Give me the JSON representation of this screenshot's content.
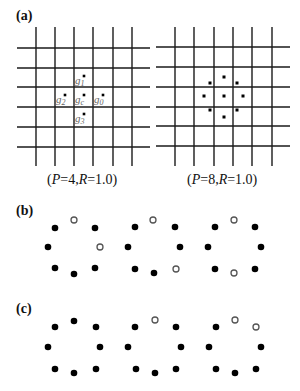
{
  "panels": {
    "a": {
      "label": "(a)",
      "left_grid": {
        "caption_P": "P",
        "caption_eq1": "=4,",
        "caption_R": "R",
        "caption_eq2": "=1.0)",
        "caption_open": "(",
        "vertical_x": [
          36,
          55,
          74,
          93,
          113,
          132
        ],
        "horizontal_y": [
          48,
          68,
          87,
          107,
          127,
          147
        ],
        "v_span": [
          27,
          166
        ],
        "h_span": [
          17,
          150
        ],
        "point_labels": [
          {
            "base": "g",
            "sub": "1",
            "x": 75,
            "y": 75,
            "dot": [
              84,
              76
            ]
          },
          {
            "base": "g",
            "sub": "2",
            "x": 56,
            "y": 94,
            "dot": [
              65,
              95
            ]
          },
          {
            "base": "g",
            "sub": "c",
            "x": 75,
            "y": 94,
            "dot": [
              84,
              95
            ]
          },
          {
            "base": "g",
            "sub": "0",
            "x": 94,
            "y": 94,
            "dot": [
              103,
              95
            ]
          },
          {
            "base": "g",
            "sub": "3",
            "x": 75,
            "y": 113,
            "dot": [
              84,
              114
            ]
          }
        ]
      },
      "right_grid": {
        "caption_P": "P",
        "caption_eq1": "=8,",
        "caption_R": "R",
        "caption_eq2": "=1.0)",
        "caption_open": "(",
        "vertical_x": [
          175,
          194,
          214,
          233,
          252,
          272
        ],
        "horizontal_y": [
          47,
          67,
          87,
          107,
          126,
          146
        ],
        "v_span": [
          27,
          166
        ],
        "h_span": [
          156,
          290
        ],
        "sample_points": [
          [
            224,
            77
          ],
          [
            210,
            83
          ],
          [
            237,
            83
          ],
          [
            204,
            96
          ],
          [
            224,
            96
          ],
          [
            243,
            96
          ],
          [
            210,
            110
          ],
          [
            224,
            117
          ],
          [
            237,
            110
          ]
        ]
      }
    },
    "b": {
      "label": "(b)",
      "patterns": [
        {
          "points": [
            {
              "x": 74,
              "y": 220,
              "open": true
            },
            {
              "x": 55,
              "y": 228,
              "open": false
            },
            {
              "x": 95,
              "y": 228,
              "open": false
            },
            {
              "x": 48,
              "y": 247,
              "open": false
            },
            {
              "x": 100,
              "y": 247,
              "open": true
            },
            {
              "x": 55,
              "y": 268,
              "open": false
            },
            {
              "x": 74,
              "y": 274,
              "open": false
            },
            {
              "x": 95,
              "y": 268,
              "open": false
            }
          ]
        },
        {
          "points": [
            {
              "x": 153,
              "y": 220,
              "open": true
            },
            {
              "x": 135,
              "y": 227,
              "open": false
            },
            {
              "x": 175,
              "y": 227,
              "open": false
            },
            {
              "x": 128,
              "y": 247,
              "open": false
            },
            {
              "x": 180,
              "y": 247,
              "open": false
            },
            {
              "x": 135,
              "y": 269,
              "open": false
            },
            {
              "x": 154,
              "y": 273,
              "open": false
            },
            {
              "x": 176,
              "y": 269,
              "open": true
            }
          ]
        },
        {
          "points": [
            {
              "x": 234,
              "y": 220,
              "open": true
            },
            {
              "x": 215,
              "y": 227,
              "open": false
            },
            {
              "x": 255,
              "y": 227,
              "open": false
            },
            {
              "x": 208,
              "y": 247,
              "open": false
            },
            {
              "x": 261,
              "y": 247,
              "open": false
            },
            {
              "x": 215,
              "y": 269,
              "open": false
            },
            {
              "x": 234,
              "y": 273,
              "open": true
            },
            {
              "x": 255,
              "y": 269,
              "open": false
            }
          ]
        }
      ]
    },
    "c": {
      "label": "(c)",
      "patterns": [
        {
          "points": [
            {
              "x": 74,
              "y": 321,
              "open": false
            },
            {
              "x": 55,
              "y": 327,
              "open": false
            },
            {
              "x": 96,
              "y": 327,
              "open": false
            },
            {
              "x": 48,
              "y": 347,
              "open": false
            },
            {
              "x": 100,
              "y": 347,
              "open": false
            },
            {
              "x": 55,
              "y": 369,
              "open": false
            },
            {
              "x": 74,
              "y": 373,
              "open": false
            },
            {
              "x": 96,
              "y": 369,
              "open": false
            }
          ]
        },
        {
          "points": [
            {
              "x": 155,
              "y": 320,
              "open": true
            },
            {
              "x": 135,
              "y": 327,
              "open": false
            },
            {
              "x": 176,
              "y": 327,
              "open": false
            },
            {
              "x": 128,
              "y": 347,
              "open": false
            },
            {
              "x": 181,
              "y": 347,
              "open": false
            },
            {
              "x": 136,
              "y": 369,
              "open": false
            },
            {
              "x": 155,
              "y": 373,
              "open": false
            },
            {
              "x": 176,
              "y": 369,
              "open": false
            }
          ]
        },
        {
          "points": [
            {
              "x": 235,
              "y": 320,
              "open": true
            },
            {
              "x": 216,
              "y": 327,
              "open": false
            },
            {
              "x": 256,
              "y": 327,
              "open": true
            },
            {
              "x": 209,
              "y": 347,
              "open": false
            },
            {
              "x": 261,
              "y": 347,
              "open": false
            },
            {
              "x": 216,
              "y": 369,
              "open": false
            },
            {
              "x": 235,
              "y": 373,
              "open": false
            },
            {
              "x": 256,
              "y": 369,
              "open": false
            }
          ]
        }
      ]
    }
  },
  "colors": {
    "grid_line": "#1a1a1a",
    "filled_dot": "#000000",
    "open_dot_stroke": "#555555",
    "label_text": "#666666"
  }
}
